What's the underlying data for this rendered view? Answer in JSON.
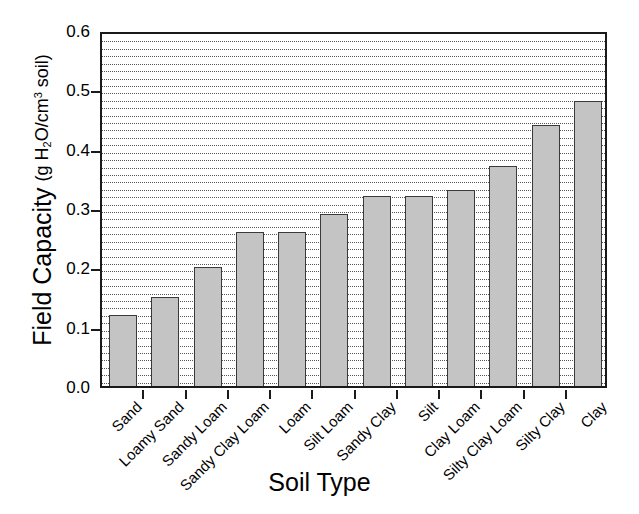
{
  "chart_data": {
    "type": "bar",
    "title": "",
    "xlabel": "Soil Type",
    "ylabel_main": "Field Capacity",
    "ylabel_unit_prefix": "(g H",
    "ylabel_unit_sub": "2",
    "ylabel_unit_mid": "O/cm",
    "ylabel_unit_sup": "3",
    "ylabel_unit_suffix": " soil)",
    "ylabel_plain": "Field Capacity (g H2O/cm3 soil)",
    "categories": [
      "Sand",
      "Loamy Sand",
      "Sandy Loam",
      "Sandy Clay Loam",
      "Loam",
      "Silt Loam",
      "Sandy Clay",
      "Silt",
      "Clay Loam",
      "Silty Clay Loam",
      "Silty Clay",
      "Clay"
    ],
    "values": [
      0.12,
      0.15,
      0.2,
      0.26,
      0.26,
      0.29,
      0.32,
      0.32,
      0.33,
      0.37,
      0.44,
      0.48
    ],
    "ylim": [
      0.0,
      0.6
    ],
    "ytick_values": [
      0.0,
      0.1,
      0.2,
      0.3,
      0.4,
      0.5,
      0.6
    ],
    "ytick_labels": [
      "0.0",
      "0.1",
      "0.2",
      "0.3",
      "0.4",
      "0.5",
      "0.6"
    ],
    "minor_gridline_step": 0.0125,
    "grid": "horizontal-dotted",
    "legend": "none",
    "bar_fill_color": "#c4c4c4",
    "bar_edge_color": "#3a3a3a",
    "axis_color": "#1a1a1a",
    "grid_color": "#555555",
    "background_color": "#ffffff",
    "xtick_label_rotation_deg": -45
  }
}
